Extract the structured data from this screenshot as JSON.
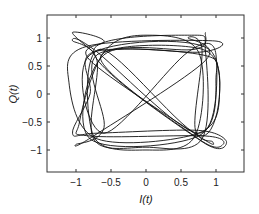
{
  "chart_data": {
    "type": "line",
    "title": "",
    "xlabel": "I(t)",
    "ylabel": "Q(t)",
    "xlim": [
      -1.42,
      1.42
    ],
    "ylim": [
      -1.4,
      1.4
    ],
    "xticks": [
      -1,
      -0.5,
      0,
      0.5,
      1
    ],
    "xtick_labels": [
      "−1",
      "−0.5",
      "0",
      "0.5",
      "1"
    ],
    "yticks": [
      1,
      0.5,
      0,
      -0.5,
      -1
    ],
    "ytick_labels": [
      "1",
      "0.5",
      "0",
      "−0.5",
      "−1"
    ],
    "grid": false,
    "legend": null,
    "line_color": "#111111",
    "series": [
      {
        "name": "trajectory",
        "points": [
          [
            -0.75,
            0.75
          ],
          [
            -1.05,
            1.1
          ],
          [
            -0.6,
            0.95
          ],
          [
            -0.8,
            0.6
          ],
          [
            0.75,
            -0.75
          ],
          [
            0.95,
            -0.85
          ],
          [
            0.7,
            -0.6
          ],
          [
            0.8,
            0.8
          ],
          [
            0.6,
            1.0
          ],
          [
            0.85,
            0.6
          ],
          [
            -0.75,
            -0.75
          ],
          [
            -1.0,
            -0.9
          ],
          [
            -0.6,
            -0.6
          ],
          [
            -0.7,
            0.7
          ],
          [
            0.8,
            0.75
          ],
          [
            0.95,
            0.95
          ],
          [
            -0.85,
            0.85
          ],
          [
            -1.1,
            0.2
          ],
          [
            -0.7,
            -0.8
          ],
          [
            0.75,
            -0.7
          ],
          [
            1.05,
            0.0
          ],
          [
            0.8,
            0.8
          ],
          [
            -0.65,
            0.65
          ],
          [
            0.75,
            -0.8
          ],
          [
            1.1,
            -0.9
          ],
          [
            0.85,
            -0.75
          ],
          [
            -0.8,
            -0.75
          ],
          [
            -0.95,
            -0.5
          ],
          [
            -0.6,
            0.75
          ],
          [
            0.0,
            1.05
          ],
          [
            0.75,
            0.75
          ],
          [
            0.7,
            -0.75
          ],
          [
            0.0,
            -1.0
          ],
          [
            -0.75,
            -0.75
          ],
          [
            -0.65,
            0.8
          ],
          [
            0.8,
            -0.75
          ],
          [
            0.9,
            0.8
          ],
          [
            -0.8,
            0.7
          ],
          [
            -0.6,
            -0.7
          ],
          [
            0.6,
            0.75
          ],
          [
            1.0,
            0.7
          ],
          [
            0.75,
            -0.7
          ],
          [
            -0.75,
            0.8
          ],
          [
            -1.05,
            0.95
          ],
          [
            -0.7,
            0.6
          ],
          [
            -0.75,
            -0.8
          ],
          [
            0.0,
            -0.95
          ],
          [
            0.8,
            -0.8
          ],
          [
            0.85,
            0.75
          ],
          [
            0.65,
            1.05
          ],
          [
            -0.75,
            0.75
          ],
          [
            0.8,
            -0.85
          ],
          [
            1.15,
            -0.85
          ],
          [
            0.75,
            -0.65
          ],
          [
            -0.7,
            -0.7
          ],
          [
            -1.05,
            -0.7
          ],
          [
            -0.8,
            0.0
          ],
          [
            -0.75,
            0.75
          ],
          [
            0.8,
            0.7
          ],
          [
            1.0,
            0.3
          ],
          [
            0.75,
            -0.75
          ],
          [
            -0.8,
            -0.8
          ],
          [
            -0.6,
            0.7
          ],
          [
            0.7,
            0.8
          ],
          [
            0.85,
            1.1
          ]
        ]
      }
    ]
  }
}
